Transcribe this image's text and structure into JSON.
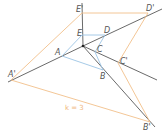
{
  "diagram": {
    "type": "enlargement",
    "scale_label": "k = 3",
    "colors": {
      "rays": "#444444",
      "original_shape": "#9cc4e4",
      "image_shape": "#f2c08a",
      "scale_label": "#f0b880"
    },
    "center": {
      "x": 83,
      "y": 46
    },
    "original_points": [
      {
        "label": "A",
        "x": 62,
        "y": 56
      },
      {
        "label": "B",
        "x": 103,
        "y": 70
      },
      {
        "label": "C",
        "x": 95,
        "y": 52
      },
      {
        "label": "D",
        "x": 105,
        "y": 35
      },
      {
        "label": "E",
        "x": 82,
        "y": 35
      }
    ],
    "image_points": [
      {
        "label": "A'",
        "x": 11,
        "y": 80
      },
      {
        "label": "B'",
        "x": 150,
        "y": 122
      },
      {
        "label": "C'",
        "x": 118,
        "y": 63
      },
      {
        "label": "D'",
        "x": 148,
        "y": 13
      },
      {
        "label": "E'",
        "x": 82,
        "y": 13
      }
    ]
  }
}
